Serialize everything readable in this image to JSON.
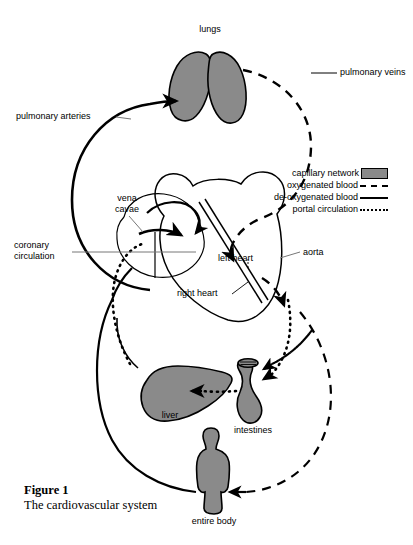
{
  "figure": {
    "number_label": "Figure 1",
    "title": "The cardiovascular system"
  },
  "colors": {
    "capillary_fill": "#8a8a8a",
    "stroke": "#000000",
    "background": "#ffffff",
    "leader_line": "#777777"
  },
  "organs": [
    {
      "id": "lungs",
      "label": "lungs"
    },
    {
      "id": "liver",
      "label": "liver"
    },
    {
      "id": "intestines",
      "label": "intestines"
    },
    {
      "id": "entire-body",
      "label": "entire body"
    }
  ],
  "vessel_labels": [
    {
      "id": "pulmonary-arteries",
      "label": "pulmonary arteries"
    },
    {
      "id": "pulmonary-veins",
      "label": "pulmonary veins"
    },
    {
      "id": "vena-cavae",
      "label": "vena\ncavae"
    },
    {
      "id": "coronary",
      "label": "coronary\ncirculation"
    },
    {
      "id": "aorta",
      "label": "aorta"
    }
  ],
  "heart_labels": [
    {
      "id": "right-heart",
      "label": "right heart"
    },
    {
      "id": "left-heart",
      "label": "left heart"
    }
  ],
  "legend": {
    "items": [
      {
        "id": "capillary-network",
        "label": "capillary network",
        "style": "swatch"
      },
      {
        "id": "oxygenated-blood",
        "label": "oxygenated blood",
        "style": "dashed"
      },
      {
        "id": "deoxygenated-blood",
        "label": "de-oxygenated blood",
        "style": "solid"
      },
      {
        "id": "portal-circulation",
        "label": "portal circulation",
        "style": "dotted"
      }
    ]
  }
}
